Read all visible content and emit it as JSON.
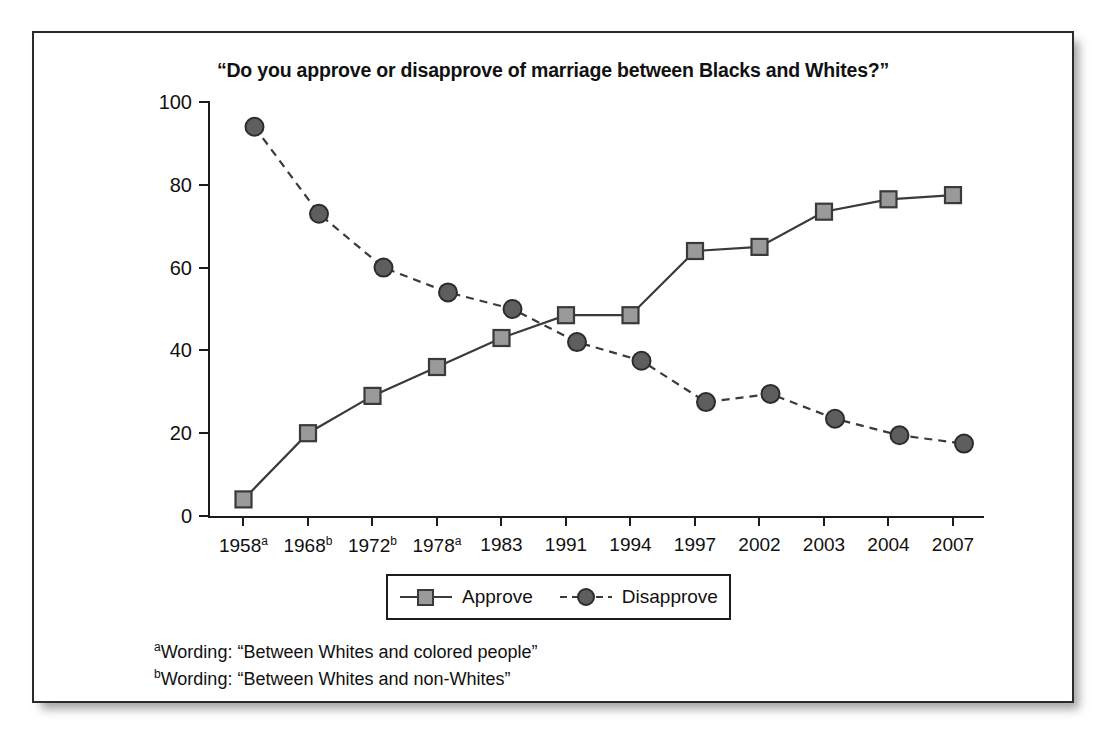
{
  "chart_data": {
    "type": "line",
    "title": "“Do you approve or disapprove of marriage between Blacks and Whites?”",
    "xlabel": "",
    "ylabel": "",
    "ylim": [
      0,
      100
    ],
    "yticks": [
      0,
      20,
      40,
      60,
      80,
      100
    ],
    "grid": false,
    "legend_position": "bottom-center",
    "categories": [
      "1958",
      "1968",
      "1972",
      "1978",
      "1983",
      "1991",
      "1994",
      "1997",
      "2002",
      "2003",
      "2004",
      "2007"
    ],
    "category_labels": [
      {
        "year": "1958",
        "footnote": "a"
      },
      {
        "year": "1968",
        "footnote": "b"
      },
      {
        "year": "1972",
        "footnote": "b"
      },
      {
        "year": "1978",
        "footnote": "a"
      },
      {
        "year": "1983",
        "footnote": ""
      },
      {
        "year": "1991",
        "footnote": ""
      },
      {
        "year": "1994",
        "footnote": ""
      },
      {
        "year": "1997",
        "footnote": ""
      },
      {
        "year": "2002",
        "footnote": ""
      },
      {
        "year": "2003",
        "footnote": ""
      },
      {
        "year": "2004",
        "footnote": ""
      },
      {
        "year": "2007",
        "footnote": ""
      }
    ],
    "series": [
      {
        "name": "Approve",
        "marker": "square",
        "linestyle": "solid",
        "color": "#3a3a3a",
        "marker_fill": "#9a9a9a",
        "values": [
          4,
          20,
          29,
          36,
          43,
          48.5,
          48.5,
          64,
          65,
          73.5,
          76.5,
          77.5
        ]
      },
      {
        "name": "Disapprove",
        "marker": "circle",
        "linestyle": "dashed",
        "color": "#3a3a3a",
        "marker_fill": "#5e5e5e",
        "values": [
          94,
          73,
          60,
          54,
          50,
          42,
          37.5,
          27.5,
          29.5,
          23.5,
          19.5,
          17.5
        ]
      }
    ],
    "footnotes": [
      {
        "marker": "a",
        "text": "Wording: “Between Whites and colored people”"
      },
      {
        "marker": "b",
        "text": "Wording: “Between Whites and non-Whites”"
      }
    ]
  },
  "legend": {
    "items": [
      {
        "label": "Approve"
      },
      {
        "label": "Disapprove"
      }
    ]
  }
}
